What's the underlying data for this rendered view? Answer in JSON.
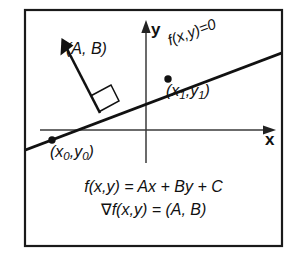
{
  "figure": {
    "type": "geometry-diagram",
    "border_color": "#1a1a1a",
    "ink_color": "#111111",
    "background_color": "#ffffff"
  },
  "axes": {
    "x_label": "x",
    "y_label": "y",
    "origin": {
      "x": 146,
      "y": 130
    },
    "x_axis": {
      "from_x": 40,
      "to_x": 272,
      "y": 130,
      "arrow": "right"
    },
    "y_axis": {
      "x": 146,
      "from_y": 163,
      "to_y": 22,
      "arrow": "up"
    }
  },
  "line": {
    "label": "f(x,y)=0",
    "slope": 0.38,
    "label_rotation_deg": -20.5,
    "start": {
      "x": 26,
      "y": 150
    },
    "end": {
      "x": 281,
      "y": 53
    }
  },
  "gradient": {
    "label": "(A, B)",
    "tail": {
      "x": 100,
      "y": 113
    },
    "tip": {
      "x": 62,
      "y": 40
    },
    "right_angle_marker": true
  },
  "points": [
    {
      "name": "point-x0-y0",
      "label_open": "(x",
      "label_sub_1": "0",
      "label_mid": ",y",
      "label_sub_2": "0",
      "label_close": ")",
      "x": 52,
      "y": 140
    },
    {
      "name": "point-x1-y1",
      "label_open": "(x",
      "label_sub_1": "1",
      "label_mid": ",y",
      "label_sub_2": "1",
      "label_close": ")",
      "x": 168,
      "y": 79
    }
  ],
  "formulas": [
    {
      "id": "function-definition",
      "text": "f(x,y) = Ax + By + C"
    },
    {
      "id": "gradient-definition",
      "nabla": "∇",
      "text": "f(x,y) = (A, B)"
    }
  ]
}
